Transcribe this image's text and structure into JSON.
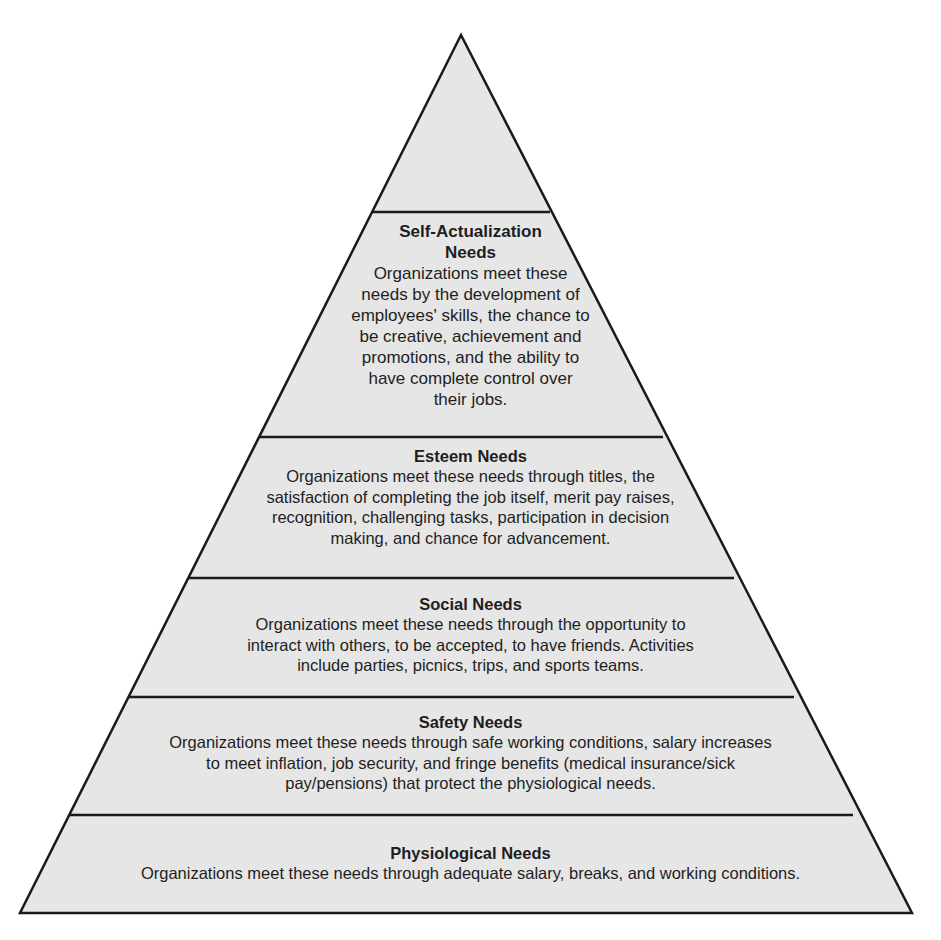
{
  "diagram": {
    "type": "pyramid",
    "fill_color": "#e6e6e6",
    "stroke_color": "#1a1a1a",
    "levels": [
      {
        "title": "Self-Actualization Needs",
        "title_lines": [
          "Self-Actualization",
          "Needs"
        ],
        "description_lines": [
          "Organizations meet these",
          "needs by the development of",
          "employees' skills, the chance to",
          "be creative, achievement and",
          "promotions, and the ability to",
          "have complete control over",
          "their jobs."
        ]
      },
      {
        "title": "Esteem Needs",
        "description_lines": [
          "Organizations meet these needs through titles, the",
          "satisfaction of completing the job itself, merit pay raises,",
          "recognition, challenging tasks, participation in decision",
          "making, and chance for advancement."
        ]
      },
      {
        "title": "Social Needs",
        "description_lines": [
          "Organizations meet these needs through the opportunity to",
          "interact with others, to be accepted, to have friends. Activities",
          "include parties, picnics, trips, and sports teams."
        ]
      },
      {
        "title": "Safety Needs",
        "description_lines": [
          "Organizations meet these needs through safe working conditions, salary increases",
          "to meet inflation, job security, and fringe benefits (medical insurance/sick",
          "pay/pensions) that protect the physiological needs."
        ]
      },
      {
        "title": "Physiological Needs",
        "description_lines": [
          "Organizations meet these needs through adequate salary, breaks, and working conditions."
        ]
      }
    ]
  }
}
